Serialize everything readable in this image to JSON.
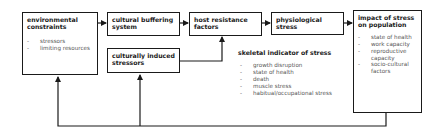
{
  "diagram": {
    "boxes": {
      "environmental_constraints": {
        "title": "environmental constraints",
        "items": [
          "stressors",
          "limiting resources"
        ]
      },
      "cultural_buffering_system": {
        "title": "cultural buffering system"
      },
      "culturally_induced_stressors": {
        "title": "culturally induced stressors"
      },
      "host_resistance_factors": {
        "title": "host resistance factors"
      },
      "physiological_stress": {
        "title": "physiological stress"
      },
      "impact_of_stress": {
        "title": "impact of stress on population",
        "items": [
          "state of health",
          "work capacity",
          "reproductive capacity",
          "socio-cultural factors"
        ]
      }
    },
    "skeletal_indicator": {
      "title": "skeletal indicator of stress",
      "items": [
        "growth disruption",
        "state of health",
        "death",
        "muscle stress",
        "habitual/occupational stress"
      ]
    },
    "colors": {
      "line": "#1a1a1a",
      "item_text": "#555555"
    }
  }
}
